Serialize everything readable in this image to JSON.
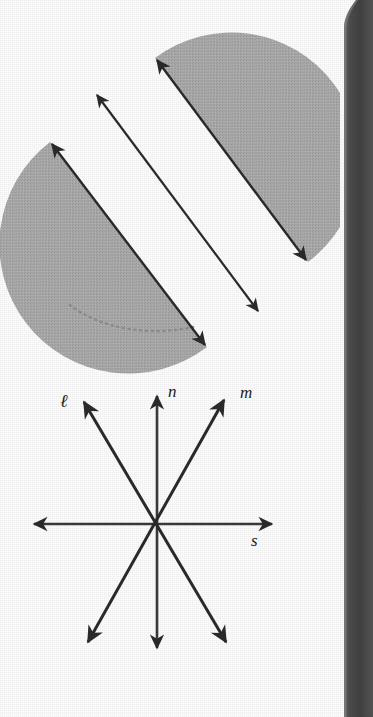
{
  "page": {
    "width": 373,
    "height": 717,
    "background_color": "#fdfdfd",
    "paper_edge": {
      "name": "book-spine-shadow",
      "color": "#4a4a4a",
      "position": "right-edge",
      "width_px": 18,
      "curves_at": "top"
    }
  },
  "figures": [
    {
      "id": "upper-figure",
      "name": "parallel-half-planes-figure",
      "description": "Two shaded half-discs (half-planes) with double-headed arrow lines along their straight diagonal edges, and a third double-headed arrow line between them.",
      "fill_color": "#a8a8a8",
      "stroke_color": "#2b2b2b",
      "elements": [
        {
          "name": "half-plane-upper-right",
          "type": "half-disc",
          "fill": "#a8a8a8"
        },
        {
          "name": "half-plane-lower-left",
          "type": "half-disc",
          "fill": "#a8a8a8"
        },
        {
          "name": "line-edge-upper-right",
          "type": "double-arrow-line"
        },
        {
          "name": "line-edge-lower-left",
          "type": "double-arrow-line"
        },
        {
          "name": "line-middle",
          "type": "double-arrow-line"
        },
        {
          "name": "dotted-arc-lower-left",
          "type": "dotted-arc"
        }
      ]
    },
    {
      "id": "lower-figure",
      "name": "concurrent-lines-figure",
      "description": "Four double-headed arrow lines concurrent at a single point, labeled l, n, m and s.",
      "stroke_color": "#2b2b2b",
      "center_point": {
        "x": 157,
        "y": 154
      },
      "lines": [
        {
          "name": "line-l",
          "label": "ℓ",
          "orientation": "diagonal-up-left"
        },
        {
          "name": "line-n",
          "label": "n",
          "orientation": "vertical"
        },
        {
          "name": "line-m",
          "label": "m",
          "orientation": "diagonal-up-right"
        },
        {
          "name": "line-s",
          "label": "s",
          "orientation": "horizontal"
        }
      ]
    }
  ],
  "labels": {
    "l": "ℓ",
    "n": "n",
    "m": "m",
    "s": "s"
  }
}
